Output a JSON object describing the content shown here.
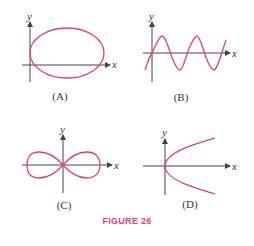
{
  "figure_title": "FIGURE 26",
  "colors": {
    "curve": "#d9427a",
    "axis": "#444444",
    "title": "#e0407a"
  },
  "panels": [
    {
      "id": "A",
      "label": "(A)",
      "curve": "ellipse",
      "x_axis": "x",
      "y_axis": "y"
    },
    {
      "id": "B",
      "label": "(B)",
      "curve": "sine wave",
      "x_axis": "x",
      "y_axis": "y"
    },
    {
      "id": "C",
      "label": "(C)",
      "curve": "lemniscate (figure eight)",
      "x_axis": "x",
      "y_axis": "y"
    },
    {
      "id": "D",
      "label": "(D)",
      "curve": "sideways parabola",
      "x_axis": "x",
      "y_axis": "y"
    }
  ]
}
